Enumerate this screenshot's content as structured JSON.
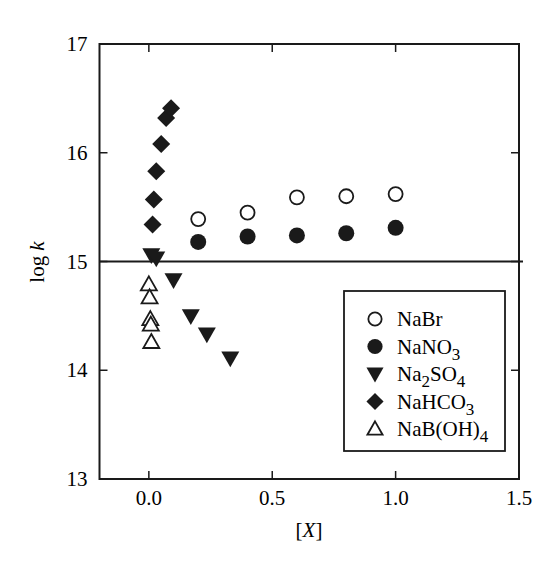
{
  "chart_data": {
    "type": "scatter",
    "title": "",
    "xlabel": "[X]",
    "ylabel": "log k",
    "xlim": [
      -0.2,
      1.5
    ],
    "ylim": [
      13,
      17
    ],
    "xticks": [
      0.0,
      0.5,
      1.0,
      1.5
    ],
    "xtick_labels": [
      "0.0",
      "0.5",
      "1.0",
      "1.5"
    ],
    "yticks": [
      13,
      14,
      15,
      16,
      17
    ],
    "ytick_labels": [
      "13",
      "14",
      "15",
      "16",
      "17"
    ],
    "grid": false,
    "reference_line": {
      "orientation": "horizontal",
      "y": 15
    },
    "legend_position": "lower right (inside)",
    "series": [
      {
        "name": "NaBr",
        "label_main": "NaBr",
        "label_sub": "",
        "label_tail": "",
        "marker": "open-circle",
        "x": [
          0.2,
          0.4,
          0.6,
          0.8,
          1.0
        ],
        "y": [
          15.39,
          15.45,
          15.59,
          15.6,
          15.62
        ]
      },
      {
        "name": "NaNO3",
        "label_main": "NaNO",
        "label_sub": "3",
        "label_tail": "",
        "marker": "filled-circle",
        "x": [
          0.2,
          0.4,
          0.6,
          0.8,
          1.0
        ],
        "y": [
          15.18,
          15.23,
          15.24,
          15.26,
          15.31
        ]
      },
      {
        "name": "Na2SO4",
        "label_main": "Na",
        "label_sub": "2",
        "label_tail": "SO",
        "label_sub2": "4",
        "marker": "filled-triangle-down",
        "x": [
          0.01,
          0.03,
          0.1,
          0.17,
          0.235,
          0.33
        ],
        "y": [
          15.06,
          15.03,
          14.83,
          14.5,
          14.33,
          14.11
        ]
      },
      {
        "name": "NaHCO3",
        "label_main": "NaHCO",
        "label_sub": "3",
        "label_tail": "",
        "marker": "filled-diamond",
        "x": [
          0.015,
          0.02,
          0.03,
          0.05,
          0.07,
          0.09
        ],
        "y": [
          15.34,
          15.57,
          15.83,
          16.08,
          16.32,
          16.41
        ]
      },
      {
        "name": "NaB(OH)4",
        "label_main": "NaB(OH)",
        "label_sub": "4",
        "label_tail": "",
        "marker": "open-triangle-up",
        "x": [
          0.0,
          0.003,
          0.006,
          0.008,
          0.01
        ],
        "y": [
          14.79,
          14.67,
          14.47,
          14.42,
          14.26
        ]
      }
    ]
  },
  "labels": {
    "xlabel": "[X]",
    "ylabel_main": "log ",
    "ylabel_italic": "k"
  }
}
